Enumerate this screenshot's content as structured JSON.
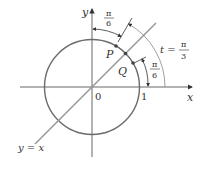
{
  "diagram": {
    "type": "unit-circle",
    "labels": {
      "y_axis": "y",
      "x_axis": "x",
      "origin": "0",
      "one": "1",
      "point_p": "P",
      "point_q": "Q",
      "line": "y = x",
      "t_eq": "t =",
      "pi": "π",
      "three": "3",
      "six": "6"
    },
    "arcs": [
      {
        "name": "arc-pi-over-6-top",
        "numerator": "π",
        "denominator": "6"
      },
      {
        "name": "arc-pi-over-6-right",
        "numerator": "π",
        "denominator": "6"
      },
      {
        "name": "arc-t-pi-over-3",
        "label": "t = π/3"
      }
    ],
    "colors": {
      "circle": "#6b6b6b",
      "axes": "#555555",
      "line": "#9a9a9a",
      "text": "#333333"
    }
  }
}
